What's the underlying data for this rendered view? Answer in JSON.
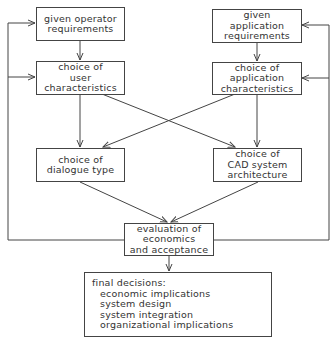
{
  "boxes": {
    "operator_req": {
      "lines": [
        "given operator",
        "requirements"
      ]
    },
    "application_req": {
      "lines": [
        "given",
        "application",
        "requirements"
      ]
    },
    "user_char": {
      "lines": [
        "choice of",
        "user",
        "characteristics"
      ]
    },
    "application_char": {
      "lines": [
        "choice of",
        "application",
        "characteristics"
      ]
    },
    "dialogue_type": {
      "lines": [
        "choice of",
        "dialogue type"
      ]
    },
    "cad_arch": {
      "lines": [
        "choice of",
        "CAD system",
        "architecture"
      ]
    },
    "evaluation": {
      "lines": [
        "evaluation of",
        "economics",
        "and acceptance"
      ]
    },
    "final": {
      "title": "final decisions:",
      "items": [
        "economic implications",
        "system design",
        "system integration",
        "organizational implications"
      ]
    }
  },
  "colors": {
    "line": "#444444",
    "text": "#333333",
    "background": "#ffffff"
  }
}
